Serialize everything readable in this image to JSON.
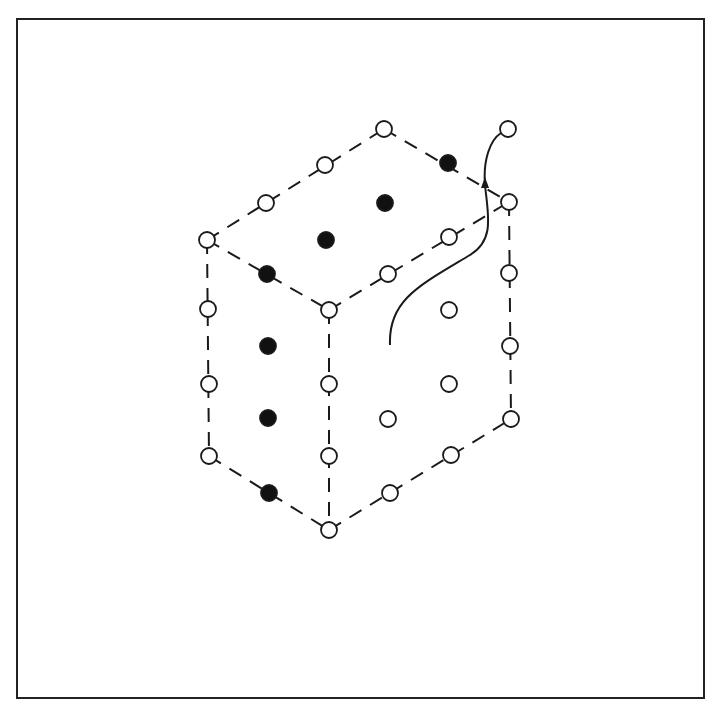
{
  "diagram": {
    "type": "isometric-cubic-lattice",
    "colors": {
      "stroke": "#1a1a1a",
      "open_fill": "#ffffff",
      "filled_fill": "#111111",
      "frame": "#222222"
    },
    "node_radius": 8,
    "edges": [
      {
        "from": [
          207,
          240
        ],
        "to": [
          384,
          129
        ]
      },
      {
        "from": [
          384,
          129
        ],
        "to": [
          509,
          202
        ]
      },
      {
        "from": [
          207,
          240
        ],
        "to": [
          329,
          310
        ]
      },
      {
        "from": [
          329,
          310
        ],
        "to": [
          509,
          202
        ]
      },
      {
        "from": [
          207,
          240
        ],
        "to": [
          209,
          456
        ]
      },
      {
        "from": [
          329,
          310
        ],
        "to": [
          329,
          530
        ]
      },
      {
        "from": [
          509,
          202
        ],
        "to": [
          511,
          419
        ]
      },
      {
        "from": [
          209,
          456
        ],
        "to": [
          329,
          530
        ]
      },
      {
        "from": [
          329,
          530
        ],
        "to": [
          511,
          419
        ]
      }
    ],
    "nodes": [
      {
        "x": 384,
        "y": 129,
        "filled": false
      },
      {
        "x": 325,
        "y": 165,
        "filled": false
      },
      {
        "x": 266,
        "y": 203,
        "filled": false
      },
      {
        "x": 207,
        "y": 240,
        "filled": false
      },
      {
        "x": 448,
        "y": 163,
        "filled": true
      },
      {
        "x": 509,
        "y": 202,
        "filled": false
      },
      {
        "x": 385,
        "y": 203,
        "filled": true
      },
      {
        "x": 326,
        "y": 240,
        "filled": true
      },
      {
        "x": 267,
        "y": 274,
        "filled": true
      },
      {
        "x": 449,
        "y": 237,
        "filled": false
      },
      {
        "x": 388,
        "y": 274,
        "filled": false
      },
      {
        "x": 329,
        "y": 310,
        "filled": false
      },
      {
        "x": 208,
        "y": 309,
        "filled": false
      },
      {
        "x": 268,
        "y": 346,
        "filled": true
      },
      {
        "x": 209,
        "y": 384,
        "filled": false
      },
      {
        "x": 268,
        "y": 418,
        "filled": true
      },
      {
        "x": 209,
        "y": 456,
        "filled": false
      },
      {
        "x": 269,
        "y": 493,
        "filled": true
      },
      {
        "x": 329,
        "y": 384,
        "filled": false
      },
      {
        "x": 329,
        "y": 456,
        "filled": false
      },
      {
        "x": 329,
        "y": 530,
        "filled": false
      },
      {
        "x": 509,
        "y": 273,
        "filled": false
      },
      {
        "x": 510,
        "y": 346,
        "filled": false
      },
      {
        "x": 511,
        "y": 419,
        "filled": false
      },
      {
        "x": 449,
        "y": 310,
        "filled": false
      },
      {
        "x": 449,
        "y": 384,
        "filled": false
      },
      {
        "x": 388,
        "y": 419,
        "filled": false
      },
      {
        "x": 451,
        "y": 455,
        "filled": false
      },
      {
        "x": 390,
        "y": 493,
        "filled": false
      },
      {
        "x": 508,
        "y": 129,
        "filled": false
      }
    ],
    "trajectory": {
      "path": "M 390 345 C 388 300, 420 285, 470 255 C 495 240, 488 215, 485 185 C 483 160, 490 140, 501 133",
      "arrow_at": [
        485,
        185
      ]
    }
  }
}
